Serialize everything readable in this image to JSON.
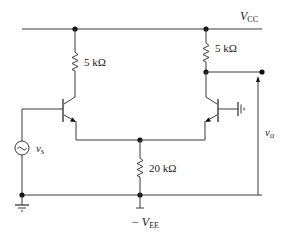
{
  "diagram": {
    "type": "circuit-schematic",
    "supplies": {
      "positive": {
        "symbol": "V",
        "subscript": "CC"
      },
      "negative": {
        "prefix": "− ",
        "symbol": "V",
        "subscript": "EE"
      }
    },
    "components": [
      {
        "id": "RC1",
        "kind": "resistor",
        "label": "5 kΩ",
        "position": "left collector"
      },
      {
        "id": "RC2",
        "kind": "resistor",
        "label": "5 kΩ",
        "position": "right collector"
      },
      {
        "id": "REE",
        "kind": "resistor",
        "label": "20 kΩ",
        "position": "emitter tail"
      },
      {
        "id": "Q1",
        "kind": "npn-transistor",
        "position": "left, base driven by source"
      },
      {
        "id": "Q2",
        "kind": "npn-transistor",
        "position": "right, base grounded"
      },
      {
        "id": "VS",
        "kind": "ac-source",
        "label": {
          "symbol": "v",
          "subscript": "s"
        }
      },
      {
        "id": "GND1",
        "kind": "ground",
        "position": "bottom left"
      },
      {
        "id": "GND2",
        "kind": "ground",
        "position": "Q2 base"
      }
    ],
    "output": {
      "label": {
        "symbol": "v",
        "subscript": "o"
      },
      "node": "Q2 collector"
    }
  }
}
